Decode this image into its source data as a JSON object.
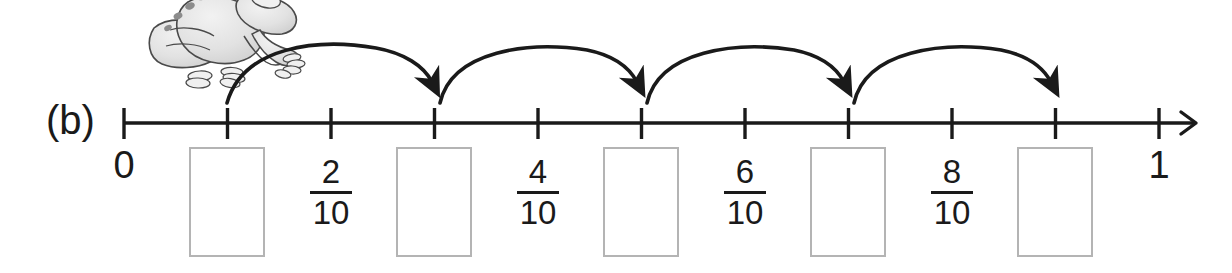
{
  "exercise": {
    "part_label": "(b)"
  },
  "number_line": {
    "start_label": "0",
    "end_label": "1",
    "total_ticks": 11,
    "denominator": 10,
    "axis_color": "#1a1a1a",
    "arrow_at_end": true,
    "tick_labels": [
      {
        "index": 0,
        "text": "0",
        "kind": "endpoint"
      },
      {
        "index": 2,
        "numerator": "2",
        "denominator": "10",
        "kind": "fraction"
      },
      {
        "index": 4,
        "numerator": "4",
        "denominator": "10",
        "kind": "fraction"
      },
      {
        "index": 6,
        "numerator": "6",
        "denominator": "10",
        "kind": "fraction"
      },
      {
        "index": 8,
        "numerator": "8",
        "denominator": "10",
        "kind": "fraction"
      },
      {
        "index": 10,
        "text": "1",
        "kind": "endpoint"
      }
    ]
  },
  "fractions": [
    {
      "numerator": "2",
      "denominator": "10"
    },
    {
      "numerator": "4",
      "denominator": "10"
    },
    {
      "numerator": "6",
      "denominator": "10"
    },
    {
      "numerator": "8",
      "denominator": "10"
    }
  ],
  "answer_boxes": [
    {
      "value": "",
      "tick_index": 1
    },
    {
      "value": "",
      "tick_index": 3
    },
    {
      "value": "",
      "tick_index": 5
    },
    {
      "value": "",
      "tick_index": 7
    },
    {
      "value": "",
      "tick_index": 9
    }
  ],
  "jumps": [
    {
      "from_tick": 0,
      "to_tick": 2
    },
    {
      "from_tick": 2,
      "to_tick": 4
    },
    {
      "from_tick": 4,
      "to_tick": 6
    },
    {
      "from_tick": 6,
      "to_tick": 8
    },
    {
      "from_tick": 8,
      "to_tick": 10
    }
  ],
  "illustration": {
    "name": "frog",
    "style": "grayscale-line-drawing"
  },
  "colors": {
    "ink": "#1a1a1a",
    "box_border": "#b4b4b4",
    "background": "#ffffff",
    "frog_fill": "#e8e8e8",
    "frog_outline": "#4a4a4a",
    "frog_spots": "#8c8c8c"
  }
}
